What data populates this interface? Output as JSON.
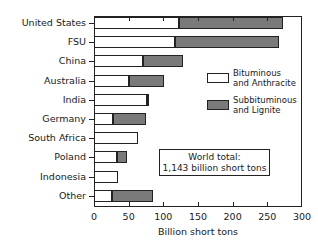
{
  "chart_data": {
    "type": "bar",
    "orientation": "horizontal",
    "stacked": true,
    "title": "",
    "xlabel": "Billion short tons",
    "ylabel": "",
    "xlim": [
      0,
      300
    ],
    "xticks": [
      0,
      50,
      100,
      150,
      200,
      250,
      300
    ],
    "categories": [
      "United States",
      "FSU",
      "China",
      "Australia",
      "India",
      "Germany",
      "South Africa",
      "Poland",
      "Indonesia",
      "Other"
    ],
    "series": [
      {
        "name": "Bituminous and Anthracite",
        "color": "#ffffff",
        "values": [
          123,
          117,
          70,
          51,
          77,
          27,
          63,
          33,
          35,
          26
        ]
      },
      {
        "name": "Subbituminous and Lignite",
        "color": "#7a7a7a",
        "values": [
          150,
          150,
          58,
          50,
          3,
          48,
          0,
          15,
          0,
          59
        ]
      }
    ],
    "totals": [
      273,
      267,
      128,
      101,
      80,
      75,
      63,
      48,
      35,
      85
    ],
    "legend": {
      "position": "right-inside",
      "entries": [
        "Bituminous and Anthracite",
        "Subbituminous and Lignite"
      ]
    },
    "annotations": [
      "World total:",
      "1,143 billion short tons"
    ],
    "grid": false
  },
  "labels": {
    "categories": [
      "United States",
      "FSU",
      "China",
      "Australia",
      "India",
      "Germany",
      "South Africa",
      "Poland",
      "Indonesia",
      "Other"
    ],
    "xticks": [
      "0",
      "50",
      "100",
      "150",
      "200",
      "250",
      "300"
    ],
    "xaxis_title": "Billion short tons",
    "legend_1_line1": "Bituminous",
    "legend_1_line2": "and Anthracite",
    "legend_2_line1": "Subbituminous",
    "legend_2_line2": "and Lignite",
    "total_line1": "World total:",
    "total_line2": "1,143 billion short tons"
  }
}
